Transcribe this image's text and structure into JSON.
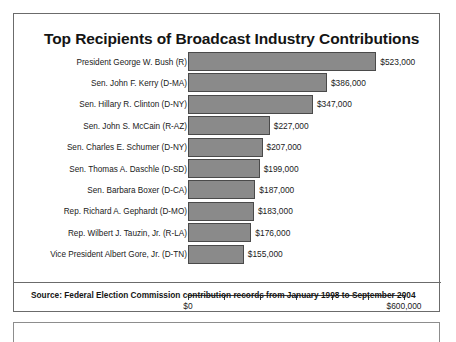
{
  "chart_data": {
    "type": "bar",
    "orientation": "horizontal",
    "title": "Top Recipients of Broadcast Industry Contributions",
    "xlabel": "",
    "ylabel": "",
    "xlim": [
      0,
      600000
    ],
    "grid": false,
    "legend": null,
    "axis_tick_labels": [
      "$0",
      "$600,000"
    ],
    "axis_tick_values": [
      0,
      100000,
      200000,
      300000,
      400000,
      500000,
      600000
    ],
    "bar_color": "#8a8a8a",
    "bar_border_color": "#4a4a4a",
    "categories": [
      "President George W. Bush (R)",
      "Sen. John F. Kerry (D-MA)",
      "Sen. Hillary R. Clinton (D-NY)",
      "Sen. John S. McCain (R-AZ)",
      "Sen. Charles E. Schumer (D-NY)",
      "Sen. Thomas A. Daschle (D-SD)",
      "Sen. Barbara Boxer (D-CA)",
      "Rep. Richard A. Gephardt (D-MO)",
      "Rep. Wilbert J. Tauzin, Jr. (R-LA)",
      "Vice President Albert Gore, Jr. (D-TN)"
    ],
    "values": [
      523000,
      386000,
      347000,
      227000,
      207000,
      199000,
      187000,
      183000,
      176000,
      155000
    ],
    "value_labels": [
      "$523,000",
      "$386,000",
      "$347,000",
      "$227,000",
      "$207,000",
      "$199,000",
      "$187,000",
      "$183,000",
      "$176,000",
      "$155,000"
    ],
    "annotations": [
      "Source: Federal Election Commission contribution records from January 1998 to September 2004"
    ]
  },
  "figure": {
    "title": "Top Recipients of Broadcast Industry Contributions",
    "source_note": "Source: Federal Election Commission contribution records from January 1998 to September 2004"
  }
}
